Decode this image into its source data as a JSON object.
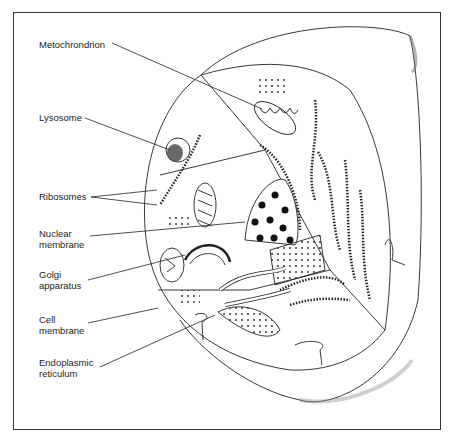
{
  "diagram": {
    "labels": [
      {
        "id": "mitochondrion",
        "text": "Metochrondrion"
      },
      {
        "id": "lysosome",
        "text": "Lysosome"
      },
      {
        "id": "ribosomes",
        "text": "Ribosomes"
      },
      {
        "id": "nuclear_membrane",
        "text": "Nuclear\nmembrane"
      },
      {
        "id": "golgi",
        "text": "Golgi\napparatus"
      },
      {
        "id": "cell_membrane",
        "text": "Cell\nmembrane"
      },
      {
        "id": "er",
        "text": "Endoplasmic\nreticulum"
      }
    ],
    "colors": {
      "ink": "#222222",
      "paper": "#ffffff",
      "frame": "#333333"
    }
  }
}
